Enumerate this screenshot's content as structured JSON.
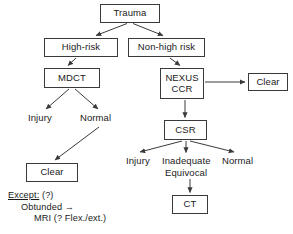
{
  "diagram": {
    "stroke_color": "#3a3a3a",
    "text_color": "#1a1a1a",
    "background": "#ffffff",
    "nodes": [
      {
        "id": "trauma",
        "label": "Trauma",
        "x": 100,
        "y": 4,
        "w": 60,
        "h": 19
      },
      {
        "id": "high-risk",
        "label": "High-risk",
        "x": 44,
        "y": 38,
        "w": 74,
        "h": 19
      },
      {
        "id": "non-high",
        "label": "Non-high risk",
        "x": 128,
        "y": 38,
        "w": 77,
        "h": 19
      },
      {
        "id": "mdct",
        "label": "MDCT",
        "x": 44,
        "y": 68,
        "w": 56,
        "h": 20
      },
      {
        "id": "nexus-ccr",
        "label": "NEXUS",
        "label2": "CCR",
        "x": 160,
        "y": 68,
        "w": 44,
        "h": 31
      },
      {
        "id": "clear-right",
        "label": "Clear",
        "x": 248,
        "y": 73,
        "w": 40,
        "h": 18
      },
      {
        "id": "csr",
        "label": "CSR",
        "x": 164,
        "y": 120,
        "w": 43,
        "h": 20
      },
      {
        "id": "clear-left",
        "label": "Clear",
        "x": 26,
        "y": 163,
        "w": 52,
        "h": 19
      },
      {
        "id": "ct",
        "label": "CT",
        "x": 172,
        "y": 195,
        "w": 36,
        "h": 19
      }
    ],
    "labels": [
      {
        "id": "mdct-injury",
        "text": "Injury",
        "x": 28,
        "y": 113
      },
      {
        "id": "mdct-normal",
        "text": "Normal",
        "x": 80,
        "y": 113
      },
      {
        "id": "csr-injury",
        "text": "Injury",
        "x": 126,
        "y": 156
      },
      {
        "id": "csr-inadequate",
        "text": "Inadequate",
        "x": 162,
        "y": 156
      },
      {
        "id": "csr-equivocal",
        "text": "Equivocal",
        "x": 165,
        "y": 168
      },
      {
        "id": "csr-normal",
        "text": "Normal",
        "x": 222,
        "y": 156
      }
    ],
    "note": {
      "id": "except-note",
      "x": 8,
      "y": 190,
      "line1_underlined": "Except:",
      "line1_rest": " (?)",
      "line2": "Obtunded →",
      "line3": "MRI (? Flex./ext.)"
    },
    "edges": [
      {
        "id": "trauma-to-high-risk",
        "from": "trauma",
        "to": "high-risk",
        "type": "arrow"
      },
      {
        "id": "trauma-to-non-high",
        "from": "trauma",
        "to": "non-high",
        "type": "arrow"
      },
      {
        "id": "high-risk-to-mdct",
        "from": "high-risk",
        "to": "mdct",
        "type": "arrow"
      },
      {
        "id": "non-high-to-nexus",
        "from": "non-high",
        "to": "nexus-ccr",
        "type": "arrow"
      },
      {
        "id": "nexus-to-clear-right",
        "from": "nexus-ccr",
        "to": "clear-right",
        "type": "arrow"
      },
      {
        "id": "nexus-to-csr",
        "from": "nexus-ccr",
        "to": "csr",
        "type": "arrow"
      },
      {
        "id": "mdct-to-injury",
        "from": "mdct",
        "to": "mdct-injury",
        "type": "arrow"
      },
      {
        "id": "mdct-to-normal",
        "from": "mdct",
        "to": "mdct-normal",
        "type": "arrow"
      },
      {
        "id": "normal-to-clear-left",
        "from": "mdct-normal",
        "to": "clear-left",
        "type": "arrow"
      },
      {
        "id": "csr-to-injury",
        "from": "csr",
        "to": "csr-injury",
        "type": "arrow"
      },
      {
        "id": "csr-to-inadequate",
        "from": "csr",
        "to": "csr-inadequate",
        "type": "arrow"
      },
      {
        "id": "csr-to-normal",
        "from": "csr",
        "to": "csr-normal",
        "type": "arrow"
      },
      {
        "id": "equivocal-to-ct",
        "from": "csr-equivocal",
        "to": "ct",
        "type": "arrow"
      }
    ]
  }
}
